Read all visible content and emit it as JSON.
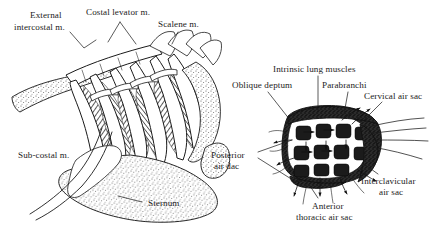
{
  "figure": {
    "background_color": "#ffffff",
    "ink_color": "#1a1a1a",
    "panels": [
      {
        "id": "left-panel",
        "name": "Thoracic skeleton and respiratory musculature",
        "labels": [
          {
            "id": "external-intercostal",
            "text_line1": "External",
            "text_line2": "intercostal m.",
            "x": 30,
            "y": 14,
            "align": "start"
          },
          {
            "id": "costal-levator",
            "text_line1": "Costal levator m.",
            "text_line2": "",
            "x": 86,
            "y": 11,
            "align": "start"
          },
          {
            "id": "scalene",
            "text_line1": "Scalene m.",
            "text_line2": "",
            "x": 158,
            "y": 22,
            "align": "start"
          },
          {
            "id": "sub-costal",
            "text_line1": "Sub-costal m.",
            "text_line2": "",
            "x": 18,
            "y": 155,
            "align": "start"
          },
          {
            "id": "sternum",
            "text_line1": "Sternum",
            "text_line2": "",
            "x": 148,
            "y": 205,
            "align": "start"
          }
        ]
      },
      {
        "id": "right-panel",
        "name": "Lung with parabranchi and air sacs",
        "labels": [
          {
            "id": "intrinsic-lung-muscles",
            "text_line1": "Intrinsic lung muscles",
            "text_line2": "",
            "x": 273,
            "y": 70,
            "align": "start"
          },
          {
            "id": "oblique-septum",
            "text_line1": "Oblique deptum",
            "text_line2": "",
            "x": 234,
            "y": 85,
            "align": "start"
          },
          {
            "id": "parabranchi",
            "text_line1": "Parabranchi",
            "text_line2": "",
            "x": 323,
            "y": 85,
            "align": "start"
          },
          {
            "id": "cervical-air-sac",
            "text_line1": "Cervical air sac",
            "text_line2": "",
            "x": 365,
            "y": 96,
            "align": "start"
          },
          {
            "id": "posterior-air-sac",
            "text_line1": "Posterior",
            "text_line2": "air dac",
            "x": 210,
            "y": 157,
            "align": "start"
          },
          {
            "id": "interclavicular-air-sac",
            "text_line1": "Interclavicular",
            "text_line2": "air sac",
            "x": 362,
            "y": 181,
            "align": "start"
          },
          {
            "id": "anterior-thoracic-air-sac",
            "text_line1": "Anterior",
            "text_line2": "thoracic air sac",
            "x": 303,
            "y": 206,
            "align": "start"
          }
        ],
        "parabranchi_grid": {
          "rows": 3,
          "columns": 4,
          "chamber_fill": "#1b1b1b"
        }
      }
    ]
  }
}
